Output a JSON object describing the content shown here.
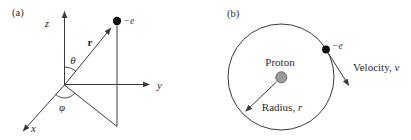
{
  "figure": {
    "panel_a": {
      "label": "(a)",
      "z_axis_label": "z",
      "y_axis_label": "y",
      "x_axis_label": "x",
      "position_vector_label": "r",
      "polar_angle_label": "θ",
      "azimuthal_angle_label": "φ",
      "electron_label": "−e"
    },
    "panel_b": {
      "label": "(b)",
      "proton_label": "Proton",
      "radius_text": "Radius, ",
      "radius_symbol": "r",
      "velocity_text": "Velocity, ",
      "velocity_symbol": "v",
      "electron_label": "−e"
    },
    "colors": {
      "line": "#3a3a3a",
      "text": "#2b2b2b",
      "proton_fill": "#9a9a9a",
      "proton_stroke": "#666666",
      "electron_fill": "#111111",
      "background": "#ffffff"
    }
  }
}
